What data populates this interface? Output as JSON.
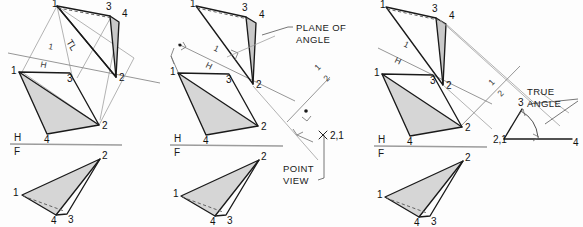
{
  "figure": {
    "background_color": "#fdfdfd",
    "fill_color": "#d4d4d4",
    "line_color": "#1a1a1a",
    "projection_color": "#9a9a9a"
  },
  "panels": [
    {
      "id": "panel-1",
      "name": "step-1-true-length",
      "labels": {
        "tl": "TL",
        "fold_h1_top": "1",
        "fold_h1_bottom": "H",
        "fold_hf_top": "H",
        "fold_hf_bottom": "F"
      },
      "aux_view_points": {
        "p1": "1",
        "p2": "2",
        "p3": "3",
        "p4": "4"
      },
      "top_view_points": {
        "p1": "1",
        "p2": "2",
        "p3": "3",
        "p4": "4"
      },
      "front_view_points": {
        "p1": "1",
        "p2": "2",
        "p3": "3",
        "p4": "4"
      }
    },
    {
      "id": "panel-2",
      "name": "step-2-point-view",
      "labels": {
        "plane_of_angle_line1": "PLANE OF",
        "plane_of_angle_line2": "ANGLE",
        "point_view_line1": "POINT",
        "point_view_line2": "VIEW",
        "point_view_mark": "2,1",
        "fold_h1_top": "1",
        "fold_h1_bottom": "H",
        "fold_12_top": "1",
        "fold_12_bottom": "2",
        "fold_hf_top": "H",
        "fold_hf_bottom": "F"
      },
      "aux_view_points": {
        "p1": "1",
        "p2": "2",
        "p3": "3",
        "p4": "4"
      },
      "top_view_points": {
        "p1": "1",
        "p2": "2",
        "p3": "3",
        "p4": "4"
      },
      "front_view_points": {
        "p1": "1",
        "p2": "2",
        "p3": "3",
        "p4": "4"
      }
    },
    {
      "id": "panel-3",
      "name": "step-3-true-angle",
      "labels": {
        "true_angle_line1": "TRUE",
        "true_angle_line2": "ANGLE",
        "angle_vertex": "2,1",
        "angle_leg_a": "3",
        "angle_leg_b": "4",
        "fold_h1_top": "1",
        "fold_h1_bottom": "H",
        "fold_12_top": "1",
        "fold_12_bottom": "2",
        "fold_hf_top": "H",
        "fold_hf_bottom": "F"
      },
      "aux_view_points": {
        "p1": "1",
        "p2": "2",
        "p3": "3",
        "p4": "4"
      },
      "top_view_points": {
        "p1": "1",
        "p2": "2",
        "p3": "3",
        "p4": "4"
      },
      "front_view_points": {
        "p1": "1",
        "p2": "2",
        "p3": "3",
        "p4": "4"
      }
    }
  ]
}
